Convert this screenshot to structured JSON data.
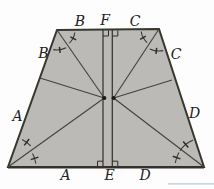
{
  "figure": {
    "vertex_labels": {
      "b_top": "B",
      "f_top": "F",
      "c_top": "C",
      "b_side": "B",
      "c_side": "C",
      "a_side": "A",
      "d_side": "D",
      "a_bottom": "A",
      "e_bottom": "E",
      "d_bottom": "D"
    },
    "colors": {
      "trapezoid_fill": "#bcbab7",
      "line": "#38362f",
      "label": "#222222",
      "background": "#fdfdfd",
      "watermark_line": "#ccd7df"
    }
  }
}
